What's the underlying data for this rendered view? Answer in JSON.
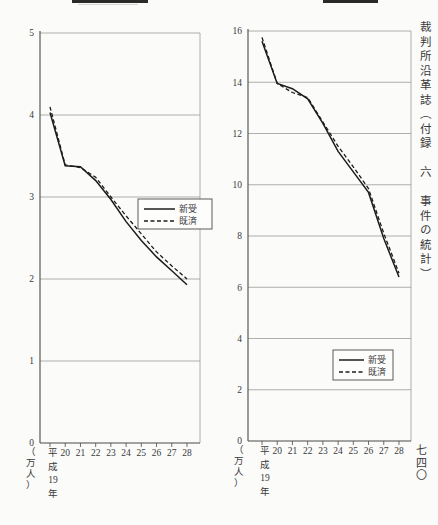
{
  "page": {
    "side_title": "裁判所沿革誌（付録　六　事件の統計）",
    "page_number": "七四〇"
  },
  "colors": {
    "line": "#1c1c1e",
    "grid": "#9c9c9a",
    "axis": "#4a4a48",
    "text": "#39393b",
    "legend_border": "#4a4a48",
    "legend_bg": "#fdfdfc",
    "background": "#fbfbf9"
  },
  "chart_data": [
    {
      "id": "left-chart",
      "type": "line",
      "title": "",
      "categories": [
        "平成19年",
        "20",
        "21",
        "22",
        "23",
        "24",
        "25",
        "26",
        "27",
        "28"
      ],
      "xlabel": "",
      "ylabel": "（万人）",
      "ylim": [
        0,
        5
      ],
      "ytick_step": 1,
      "yticks": [
        0,
        1,
        2,
        3,
        4,
        5
      ],
      "grid": true,
      "legend_position": "middle-right",
      "legend_entries": [
        "新受",
        "既済"
      ],
      "series": [
        {
          "name": "新受",
          "style": "solid",
          "values": [
            4.03,
            3.38,
            3.37,
            3.2,
            2.97,
            2.7,
            2.47,
            2.27,
            2.1,
            1.93
          ]
        },
        {
          "name": "既済",
          "style": "dashed",
          "values": [
            4.1,
            3.39,
            3.36,
            3.24,
            3.0,
            2.77,
            2.55,
            2.33,
            2.16,
            2.0
          ]
        }
      ]
    },
    {
      "id": "right-chart",
      "type": "line",
      "title": "",
      "categories": [
        "平成19年",
        "20",
        "21",
        "22",
        "23",
        "24",
        "25",
        "26",
        "27",
        "28"
      ],
      "xlabel": "",
      "ylabel": "（万人）",
      "ylim": [
        0,
        16
      ],
      "ytick_step": 2,
      "yticks": [
        0,
        2,
        4,
        6,
        8,
        10,
        12,
        14,
        16
      ],
      "grid": true,
      "legend_position": "lower-right",
      "legend_entries": [
        "新受",
        "既済"
      ],
      "series": [
        {
          "name": "新受",
          "style": "solid",
          "values": [
            15.6,
            13.95,
            13.75,
            13.35,
            12.4,
            11.3,
            10.5,
            9.7,
            7.9,
            6.4
          ]
        },
        {
          "name": "既済",
          "style": "dashed",
          "values": [
            15.75,
            13.95,
            13.6,
            13.4,
            12.45,
            11.5,
            10.7,
            9.85,
            8.1,
            6.55
          ]
        }
      ]
    }
  ]
}
